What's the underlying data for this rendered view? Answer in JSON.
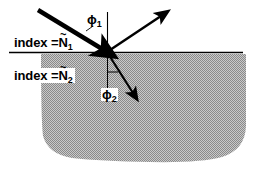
{
  "figure": {
    "background_color": "#ffffff",
    "medium_fill_color": "#a8a8a8",
    "line_color": "#000000",
    "width": 255,
    "height": 177
  },
  "labels": {
    "index_1": {
      "prefix": "index =",
      "symbol": "N",
      "accent": "~",
      "subscript": "1",
      "full_text": "index = Ñ1"
    },
    "index_2": {
      "prefix": "index =",
      "symbol": "N",
      "accent": "~",
      "subscript": "2",
      "full_text": "index = Ñ2"
    },
    "phi_1": {
      "symbol": "ϕ",
      "subscript": "1",
      "full_text": "ϕ1"
    },
    "phi_2": {
      "symbol": "ϕ",
      "subscript": "2",
      "full_text": "ϕ2"
    }
  },
  "geometry": {
    "origin": {
      "x": 107,
      "y": 52
    },
    "interface_line": {
      "x1": 9,
      "y1": 52,
      "x2": 243,
      "y2": 52
    },
    "normal_above": {
      "x1": 107,
      "y1": 12,
      "x2": 107,
      "y2": 52
    },
    "normal_below": {
      "x1": 107,
      "y1": 52,
      "x2": 107,
      "y2": 99
    },
    "incident_ray": {
      "x1": 38,
      "y1": 10,
      "x2": 107,
      "y2": 52,
      "label": "incident-ray"
    },
    "reflected_ray": {
      "x1": 107,
      "y1": 52,
      "x2": 165,
      "y2": 13,
      "label": "reflected-ray"
    },
    "refracted_ray": {
      "x1": 107,
      "y1": 52,
      "x2": 136,
      "y2": 98,
      "label": "refracted-ray"
    },
    "phi1_tick": {
      "x1": 88,
      "y1": 30,
      "x2": 97,
      "y2": 24
    },
    "phi2_tick": {
      "x1": 107,
      "y1": 72,
      "x2": 117,
      "y2": 72
    },
    "medium_shape_top_y": 54,
    "medium_shape_left_x": 41,
    "medium_shape_right_x": 246,
    "medium_shape_bottom_y": 161
  }
}
